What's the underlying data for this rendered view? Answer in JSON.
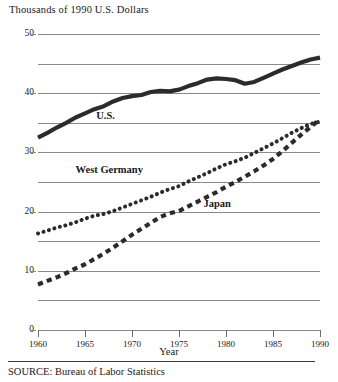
{
  "figure": {
    "y_axis_title": "Thousands of 1990 U.S. Dollars",
    "x_axis_title": "Year",
    "source": "SOURCE: Bureau of Labor Statistics"
  },
  "labels": {
    "us": "U.S.",
    "west_germany": "West Germany",
    "japan": "Japan"
  },
  "colors": {
    "line": "#2b2b2b",
    "grid": "#8a8a8a",
    "text": "#1a1a1a",
    "background": "#ffffff"
  },
  "chart_data": {
    "type": "line",
    "title": "",
    "subtitle": "",
    "xlabel": "Year",
    "ylabel": "Thousands of 1990 U.S. Dollars",
    "xlim": [
      1960,
      1990
    ],
    "ylim": [
      0,
      50
    ],
    "grid": true,
    "legend_position": "inline-annotations",
    "y_tick_labels": [
      "0",
      "10",
      "20",
      "30",
      "40",
      "50"
    ],
    "y_ticks": [
      0,
      10,
      20,
      30,
      40,
      50
    ],
    "y_gridlines": [
      0,
      5,
      10,
      15,
      20,
      25,
      30,
      35,
      40,
      45,
      50
    ],
    "x_ticks": [
      1960,
      1965,
      1970,
      1975,
      1980,
      1985,
      1990
    ],
    "x_tick_labels": [
      "1960",
      "1965",
      "1970",
      "1975",
      "1980",
      "1985",
      "1990"
    ],
    "x": [
      1960,
      1961,
      1962,
      1963,
      1964,
      1965,
      1966,
      1967,
      1968,
      1969,
      1970,
      1971,
      1972,
      1973,
      1974,
      1975,
      1976,
      1977,
      1978,
      1979,
      1980,
      1981,
      1982,
      1983,
      1984,
      1985,
      1986,
      1987,
      1988,
      1989,
      1990
    ],
    "series": [
      {
        "name": "U.S.",
        "style": "solid-thick",
        "values": [
          32.5,
          33.3,
          34.2,
          35.0,
          35.9,
          36.6,
          37.3,
          37.8,
          38.6,
          39.2,
          39.5,
          39.7,
          40.2,
          40.4,
          40.3,
          40.6,
          41.2,
          41.7,
          42.3,
          42.5,
          42.4,
          42.2,
          41.6,
          41.9,
          42.6,
          43.3,
          44.0,
          44.6,
          45.2,
          45.7,
          46.0
        ]
      },
      {
        "name": "West Germany",
        "style": "dotted",
        "values": [
          16.3,
          16.8,
          17.3,
          17.7,
          18.2,
          18.8,
          19.3,
          19.6,
          20.1,
          20.7,
          21.3,
          21.9,
          22.5,
          23.2,
          23.8,
          24.3,
          25.1,
          25.8,
          26.5,
          27.3,
          28.0,
          28.5,
          29.1,
          29.9,
          30.7,
          31.5,
          32.4,
          33.3,
          34.1,
          34.8,
          35.2
        ]
      },
      {
        "name": "Japan",
        "style": "dashed",
        "values": [
          7.7,
          8.3,
          8.9,
          9.6,
          10.4,
          11.1,
          12.0,
          12.9,
          13.9,
          15.0,
          16.1,
          17.1,
          18.1,
          19.1,
          19.7,
          20.1,
          20.9,
          21.7,
          22.5,
          23.3,
          24.2,
          25.0,
          25.9,
          26.8,
          27.8,
          28.9,
          30.2,
          31.6,
          33.0,
          34.3,
          35.6
        ]
      }
    ]
  }
}
